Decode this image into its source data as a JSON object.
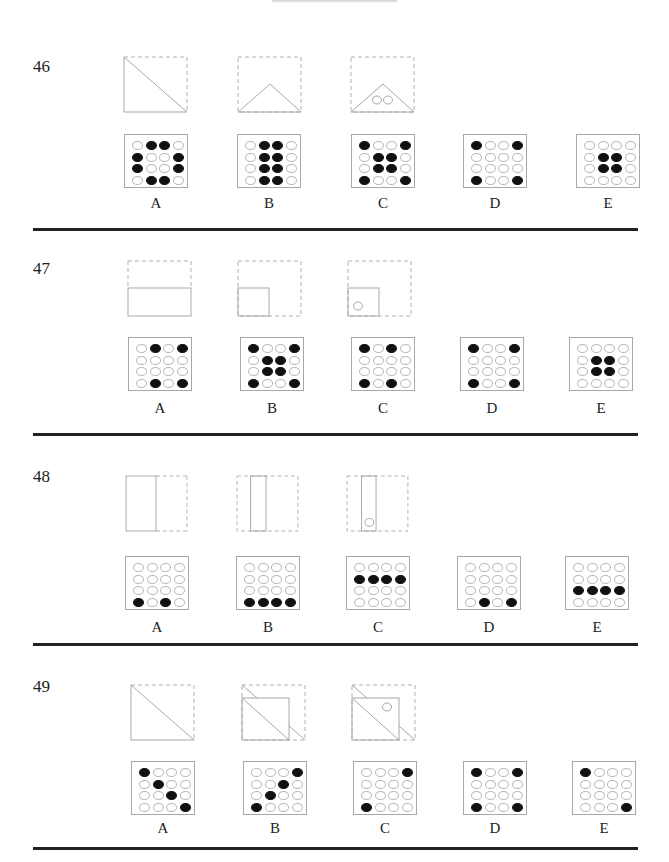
{
  "page": {
    "clipped_heading_visible": true
  },
  "problems": [
    {
      "number": "46",
      "folds": [
        {
          "type": "diag-fold-1"
        },
        {
          "type": "diag-fold-2"
        },
        {
          "type": "diag-fold-3",
          "holes": 2
        }
      ],
      "options": [
        {
          "label": "A",
          "grid": [
            [
              0,
              1,
              1,
              0
            ],
            [
              1,
              0,
              0,
              1
            ],
            [
              1,
              0,
              0,
              1
            ],
            [
              0,
              1,
              1,
              0
            ]
          ]
        },
        {
          "label": "B",
          "grid": [
            [
              0,
              1,
              1,
              0
            ],
            [
              0,
              1,
              1,
              0
            ],
            [
              0,
              1,
              1,
              0
            ],
            [
              0,
              1,
              1,
              0
            ]
          ]
        },
        {
          "label": "C",
          "grid": [
            [
              1,
              0,
              0,
              1
            ],
            [
              0,
              1,
              1,
              0
            ],
            [
              0,
              1,
              1,
              0
            ],
            [
              1,
              0,
              0,
              1
            ]
          ]
        },
        {
          "label": "D",
          "grid": [
            [
              1,
              0,
              0,
              1
            ],
            [
              0,
              0,
              0,
              0
            ],
            [
              0,
              0,
              0,
              0
            ],
            [
              1,
              0,
              0,
              1
            ]
          ]
        },
        {
          "label": "E",
          "grid": [
            [
              0,
              0,
              0,
              0
            ],
            [
              0,
              1,
              1,
              0
            ],
            [
              0,
              1,
              1,
              0
            ],
            [
              0,
              0,
              0,
              0
            ]
          ]
        }
      ]
    },
    {
      "number": "47",
      "folds": [
        {
          "type": "horiz-fold-1"
        },
        {
          "type": "quarter-fold-2"
        },
        {
          "type": "quarter-fold-3",
          "holes": 1
        }
      ],
      "options": [
        {
          "label": "A",
          "grid": [
            [
              0,
              1,
              0,
              1
            ],
            [
              0,
              0,
              0,
              0
            ],
            [
              0,
              0,
              0,
              0
            ],
            [
              0,
              1,
              0,
              1
            ]
          ]
        },
        {
          "label": "B",
          "grid": [
            [
              1,
              0,
              0,
              1
            ],
            [
              0,
              1,
              1,
              0
            ],
            [
              0,
              1,
              1,
              0
            ],
            [
              1,
              0,
              0,
              1
            ]
          ]
        },
        {
          "label": "C",
          "grid": [
            [
              1,
              0,
              1,
              0
            ],
            [
              0,
              0,
              0,
              0
            ],
            [
              0,
              0,
              0,
              0
            ],
            [
              1,
              0,
              1,
              0
            ]
          ]
        },
        {
          "label": "D",
          "grid": [
            [
              1,
              0,
              0,
              1
            ],
            [
              0,
              0,
              0,
              0
            ],
            [
              0,
              0,
              0,
              0
            ],
            [
              1,
              0,
              0,
              1
            ]
          ]
        },
        {
          "label": "E",
          "grid": [
            [
              0,
              0,
              0,
              0
            ],
            [
              0,
              1,
              1,
              0
            ],
            [
              0,
              1,
              1,
              0
            ],
            [
              0,
              0,
              0,
              0
            ]
          ]
        }
      ]
    },
    {
      "number": "48",
      "folds": [
        {
          "type": "vert-fold-1"
        },
        {
          "type": "vert-fold-2"
        },
        {
          "type": "vert-fold-3",
          "holes": 1
        }
      ],
      "options": [
        {
          "label": "A",
          "grid": [
            [
              0,
              0,
              0,
              0
            ],
            [
              0,
              0,
              0,
              0
            ],
            [
              0,
              0,
              0,
              0
            ],
            [
              1,
              0,
              1,
              0
            ]
          ]
        },
        {
          "label": "B",
          "grid": [
            [
              0,
              0,
              0,
              0
            ],
            [
              0,
              0,
              0,
              0
            ],
            [
              0,
              0,
              0,
              0
            ],
            [
              1,
              1,
              1,
              1
            ]
          ]
        },
        {
          "label": "C",
          "grid": [
            [
              0,
              0,
              0,
              0
            ],
            [
              1,
              1,
              1,
              1
            ],
            [
              0,
              0,
              0,
              0
            ],
            [
              0,
              0,
              0,
              0
            ]
          ]
        },
        {
          "label": "D",
          "grid": [
            [
              0,
              0,
              0,
              0
            ],
            [
              0,
              0,
              0,
              0
            ],
            [
              0,
              0,
              0,
              0
            ],
            [
              0,
              1,
              0,
              1
            ]
          ]
        },
        {
          "label": "E",
          "grid": [
            [
              0,
              0,
              0,
              0
            ],
            [
              0,
              0,
              0,
              0
            ],
            [
              1,
              1,
              1,
              1
            ],
            [
              0,
              0,
              0,
              0
            ]
          ]
        }
      ]
    },
    {
      "number": "49",
      "folds": [
        {
          "type": "diag-fold-1"
        },
        {
          "type": "diag-square-fold-2"
        },
        {
          "type": "diag-square-fold-3",
          "holes": 1
        }
      ],
      "options": [
        {
          "label": "A",
          "grid": [
            [
              1,
              0,
              0,
              0
            ],
            [
              0,
              1,
              0,
              0
            ],
            [
              0,
              0,
              1,
              0
            ],
            [
              0,
              0,
              0,
              1
            ]
          ]
        },
        {
          "label": "B",
          "grid": [
            [
              0,
              0,
              0,
              1
            ],
            [
              0,
              0,
              1,
              0
            ],
            [
              0,
              1,
              0,
              0
            ],
            [
              1,
              0,
              0,
              0
            ]
          ]
        },
        {
          "label": "C",
          "grid": [
            [
              0,
              0,
              0,
              1
            ],
            [
              0,
              0,
              0,
              0
            ],
            [
              0,
              0,
              0,
              0
            ],
            [
              1,
              0,
              0,
              0
            ]
          ]
        },
        {
          "label": "D",
          "grid": [
            [
              1,
              0,
              0,
              1
            ],
            [
              0,
              0,
              0,
              0
            ],
            [
              0,
              0,
              0,
              0
            ],
            [
              1,
              0,
              0,
              1
            ]
          ]
        },
        {
          "label": "E",
          "grid": [
            [
              1,
              0,
              0,
              0
            ],
            [
              0,
              0,
              0,
              0
            ],
            [
              0,
              0,
              0,
              0
            ],
            [
              0,
              0,
              0,
              1
            ]
          ]
        }
      ]
    }
  ],
  "colors": {
    "ink": "#222222",
    "line": "#a8a8a8",
    "dashed": "#b0b0b0",
    "filled_hole": "#111111"
  }
}
